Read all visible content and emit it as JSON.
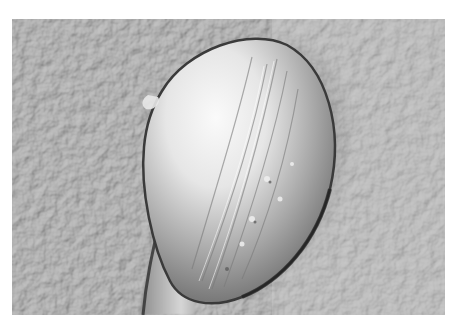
{
  "image": {
    "description": "Grayscale scanning electron micrograph of a single ovoid, shell-like body with a tapering stalk on a finely textured substrate",
    "colors": {
      "background": "#ffffff",
      "substrate": "#b9b9b9",
      "highlight": "#f4f4f4",
      "shadow": "#3a3a3a"
    }
  }
}
